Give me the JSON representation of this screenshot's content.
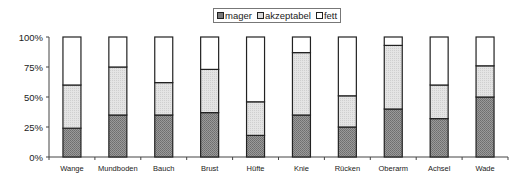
{
  "chart_data": {
    "type": "bar",
    "stacked": true,
    "percent_stacked": true,
    "title": "",
    "xlabel": "",
    "ylabel": "",
    "ylim": [
      0,
      100
    ],
    "yticks": [
      "0%",
      "25%",
      "50%",
      "75%",
      "100%"
    ],
    "categories": [
      "Wange",
      "Mundboden",
      "Bauch",
      "Brust",
      "Hüfte",
      "Knie",
      "Rücken",
      "Oberarm",
      "Achsel",
      "Wade"
    ],
    "series": [
      {
        "name": "mager",
        "values": [
          24,
          35,
          35,
          37,
          18,
          35,
          25,
          40,
          32,
          50
        ],
        "color": "#8c8c8c"
      },
      {
        "name": "akzeptabel",
        "values": [
          36,
          40,
          27,
          36,
          28,
          52,
          26,
          53,
          28,
          26
        ],
        "color": "#dcdcdc"
      },
      {
        "name": "fett",
        "values": [
          40,
          25,
          38,
          27,
          54,
          13,
          49,
          7,
          40,
          24
        ],
        "color": "#ffffff"
      }
    ],
    "legend_position": "top",
    "grid": false
  },
  "legend": {
    "items": [
      {
        "label": "mager",
        "color": "#8c8c8c"
      },
      {
        "label": "akzeptabel",
        "color": "#dcdcdc"
      },
      {
        "label": "fett",
        "color": "#ffffff"
      }
    ]
  }
}
